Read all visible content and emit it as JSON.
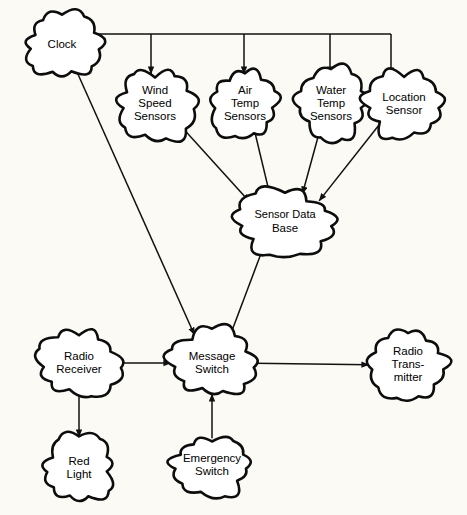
{
  "diagram": {
    "type": "data-flow-diagram",
    "background_color": "#fbfaf4",
    "node_fill_color": "#ffffff",
    "node_stroke_color": "#0d0d0d",
    "edge_color": "#111111",
    "nodes": [
      {
        "id": "clock",
        "label": "Clock",
        "lines": [
          "Clock"
        ],
        "cx": 62,
        "cy": 45,
        "rx": 36,
        "ry": 30
      },
      {
        "id": "wind_speed",
        "label": "Wind Speed Sensors",
        "lines": [
          "Wind",
          "Speed",
          "Sensors"
        ],
        "cx": 155,
        "cy": 104,
        "rx": 36,
        "ry": 33
      },
      {
        "id": "air_temp",
        "label": "Air Temp Sensors",
        "lines": [
          "Air",
          "Temp",
          "Sensors"
        ],
        "cx": 245,
        "cy": 104,
        "rx": 34,
        "ry": 33
      },
      {
        "id": "water_temp",
        "label": "Water Temp Sensors",
        "lines": [
          "Water",
          "Temp",
          "Sensors"
        ],
        "cx": 331,
        "cy": 104,
        "rx": 35,
        "ry": 33
      },
      {
        "id": "location_sensor",
        "label": "Location Sensor",
        "lines": [
          "Location",
          "Sensor"
        ],
        "cx": 404,
        "cy": 104,
        "rx": 38,
        "ry": 32
      },
      {
        "id": "sensor_db",
        "label": "Sensor Data Base",
        "lines": [
          "Sensor Data",
          "Base"
        ],
        "cx": 285,
        "cy": 222,
        "rx": 48,
        "ry": 30
      },
      {
        "id": "message_switch",
        "label": "Message Switch",
        "lines": [
          "Message",
          "Switch"
        ],
        "cx": 212,
        "cy": 363,
        "rx": 41,
        "ry": 31
      },
      {
        "id": "radio_receiver",
        "label": "Radio Receiver",
        "lines": [
          "Radio",
          "Receiver"
        ],
        "cx": 79,
        "cy": 363,
        "rx": 39,
        "ry": 31
      },
      {
        "id": "red_light",
        "label": "Red Light",
        "lines": [
          "Red",
          "Light"
        ],
        "cx": 79,
        "cy": 468,
        "rx": 35,
        "ry": 31
      },
      {
        "id": "emergency_switch",
        "label": "Emergency Switch",
        "lines": [
          "Emergency",
          "Switch"
        ],
        "cx": 212,
        "cy": 465,
        "rx": 40,
        "ry": 29
      },
      {
        "id": "radio_transmitter",
        "label": "Radio Transmitter",
        "lines": [
          "Radio",
          "Trans-",
          "mitter"
        ],
        "cx": 408,
        "cy": 365,
        "rx": 39,
        "ry": 34
      }
    ],
    "edges": [
      {
        "id": "clock-to-wind",
        "from": "clock",
        "to": "wind_speed",
        "style": "orthogonal-bus"
      },
      {
        "id": "clock-to-air",
        "from": "clock",
        "to": "air_temp",
        "style": "orthogonal-bus"
      },
      {
        "id": "clock-to-water",
        "from": "clock",
        "to": "water_temp",
        "style": "orthogonal-bus"
      },
      {
        "id": "clock-to-location",
        "from": "clock",
        "to": "location_sensor",
        "style": "orthogonal-bus"
      },
      {
        "id": "clock-to-message",
        "from": "clock",
        "to": "message_switch",
        "style": "straight"
      },
      {
        "id": "wind-to-db",
        "from": "wind_speed",
        "to": "sensor_db",
        "style": "straight"
      },
      {
        "id": "air-to-db",
        "from": "air_temp",
        "to": "sensor_db",
        "style": "straight"
      },
      {
        "id": "water-to-db",
        "from": "water_temp",
        "to": "sensor_db",
        "style": "straight"
      },
      {
        "id": "location-to-db",
        "from": "location_sensor",
        "to": "sensor_db",
        "style": "straight"
      },
      {
        "id": "message-to-db",
        "from": "message_switch",
        "to": "sensor_db",
        "style": "straight"
      },
      {
        "id": "receiver-to-message",
        "from": "radio_receiver",
        "to": "message_switch",
        "style": "straight"
      },
      {
        "id": "receiver-to-redlight",
        "from": "radio_receiver",
        "to": "red_light",
        "style": "straight"
      },
      {
        "id": "emergency-to-message",
        "from": "emergency_switch",
        "to": "message_switch",
        "style": "straight"
      },
      {
        "id": "message-to-transmitter",
        "from": "message_switch",
        "to": "radio_transmitter",
        "style": "straight"
      }
    ]
  }
}
